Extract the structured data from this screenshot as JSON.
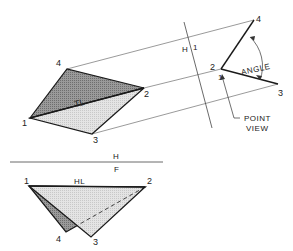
{
  "diagram": {
    "title": "",
    "colors": {
      "background": "#ffffff",
      "line": "#1a1a1a",
      "thin_line": "#444444",
      "dark_fill": "#8c8c8c",
      "light_fill": "#dcdcdc"
    },
    "top_view": {
      "points": {
        "1": [
          30,
          118
        ],
        "2": [
          144,
          88
        ],
        "3": [
          92,
          134
        ],
        "4": [
          67,
          69
        ]
      },
      "labels": {
        "p1": "1",
        "p2": "2",
        "p3": "3",
        "p4": "4",
        "true_length": "TL"
      }
    },
    "aux_view": {
      "points": {
        "4": [
          254,
          20
        ],
        "21": [
          221,
          69
        ],
        "3": [
          278,
          84
        ]
      },
      "labels": {
        "p4": "4",
        "p2": "2",
        "p1": "1",
        "p3": "3",
        "angle": "ANGLE",
        "point_view_1": "POINT",
        "point_view_2": "VIEW"
      },
      "fold_line_label_h": "H",
      "fold_line_label_1": "1"
    },
    "front_view": {
      "points": {
        "1": [
          29,
          186
        ],
        "2": [
          145,
          187
        ],
        "3": [
          91,
          237
        ],
        "4": [
          66,
          232
        ]
      },
      "labels": {
        "p1": "1",
        "p2": "2",
        "p3": "3",
        "p4": "4",
        "horizontal_line": "HL"
      }
    },
    "fold_line_hf": {
      "label_top": "H",
      "label_bottom": "F"
    }
  }
}
